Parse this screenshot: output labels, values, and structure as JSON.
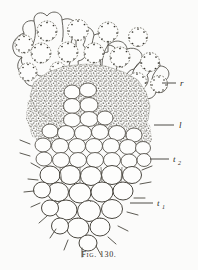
{
  "figure": {
    "caption": "Fig. 130.",
    "background_color": "#fbfbfa",
    "ink_color": "#3a3833",
    "title_alt": "Cross-section of plant tissue",
    "labels": [
      {
        "id": "r",
        "text": "r",
        "sub": "",
        "x": 182,
        "y": 86,
        "leader_x1": 162,
        "leader_y1": 83,
        "leader_x2": 176,
        "leader_y2": 83
      },
      {
        "id": "l",
        "text": "l",
        "sub": "",
        "x": 181,
        "y": 128,
        "leader_x1": 155,
        "leader_y1": 125,
        "leader_x2": 175,
        "leader_y2": 125
      },
      {
        "id": "t2",
        "text": "t",
        "sub": "2",
        "x": 176,
        "y": 162,
        "leader_x1": 150,
        "leader_y1": 159,
        "leader_x2": 170,
        "leader_y2": 159
      },
      {
        "id": "t1",
        "text": "t",
        "sub": "1",
        "x": 160,
        "y": 206,
        "leader_x1": 130,
        "leader_y1": 203,
        "leader_x2": 154,
        "leader_y2": 203
      }
    ],
    "regions": [
      {
        "id": "r",
        "name": "outer-cell-layer"
      },
      {
        "id": "l",
        "name": "dense-granular-layer"
      },
      {
        "id": "t2",
        "name": "medium-cell-layer"
      },
      {
        "id": "t1",
        "name": "large-apex-cell-layer"
      }
    ]
  }
}
